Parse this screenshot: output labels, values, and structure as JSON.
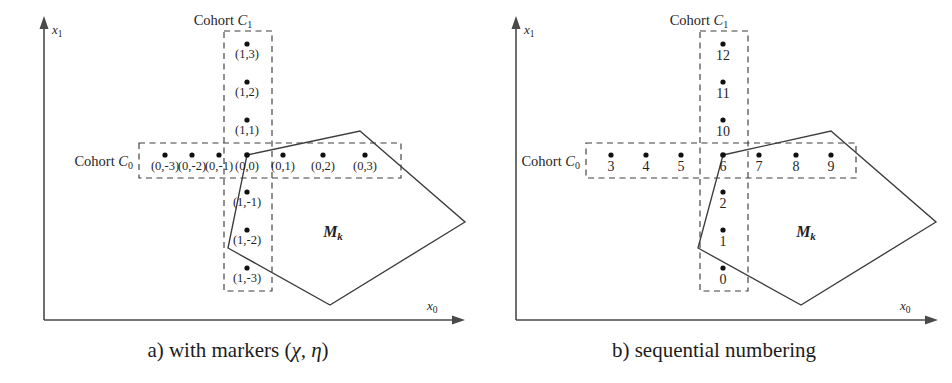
{
  "figure": {
    "panels": [
      {
        "id": "panel-a",
        "caption_prefix": "a) with markers (",
        "caption_greek": "χ, η",
        "caption_suffix": ")",
        "caption_full": "a) with markers (χ, η)",
        "axis_x_label": "x",
        "axis_x_sub": "0",
        "axis_y_label": "x",
        "axis_y_sub": "1",
        "cohort_c0_label": "Cohort ",
        "cohort_c0_italic": "C",
        "cohort_c0_sub": "0",
        "cohort_c1_label": "Cohort ",
        "cohort_c1_italic": "C",
        "cohort_c1_sub": "1",
        "region_label": "M",
        "region_sub": "k",
        "horizontal_markers": [
          "(0,-3)",
          "(0,-2)",
          "(0,-1)",
          "(0,0)",
          "(0,1)",
          "(0,2)",
          "(0,3)"
        ],
        "vertical_markers_up": [
          "(1,1)",
          "(1,2)",
          "(1,3)"
        ],
        "vertical_markers_down": [
          "(1,-1)",
          "(1,-2)",
          "(1,-3)"
        ]
      },
      {
        "id": "panel-b",
        "caption_prefix": "b) sequential numbering",
        "caption_greek": "",
        "caption_suffix": "",
        "caption_full": "b) sequential numbering",
        "axis_x_label": "x",
        "axis_x_sub": "0",
        "axis_y_label": "x",
        "axis_y_sub": "1",
        "cohort_c0_label": "Cohort ",
        "cohort_c0_italic": "C",
        "cohort_c0_sub": "0",
        "cohort_c1_label": "Cohort ",
        "cohort_c1_italic": "C",
        "cohort_c1_sub": "1",
        "region_label": "M",
        "region_sub": "k",
        "horizontal_markers": [
          "3",
          "4",
          "5",
          "6",
          "7",
          "8",
          "9"
        ],
        "vertical_markers_up": [
          "10",
          "11",
          "12"
        ],
        "vertical_markers_down": [
          "2",
          "1",
          "0"
        ]
      }
    ],
    "colors": {
      "stroke": "#3c3c3c",
      "axis": "#4a4a4a",
      "point": "#111111",
      "text": "#1f1f1f",
      "background": "#ffffff"
    }
  }
}
